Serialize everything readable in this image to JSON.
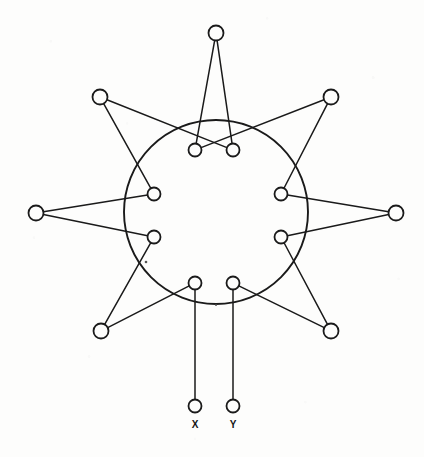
{
  "figure": {
    "kind": "node-link-diagram",
    "background_color": "#fdfdfc",
    "ink_color": "#1a1a1a"
  },
  "chart_data": {
    "type": "diagram",
    "title": "",
    "ring": {
      "cx": 216,
      "cy": 212,
      "r": 92,
      "label": "central-ring"
    },
    "labels": [
      {
        "id": "X",
        "text": "X",
        "x": 195,
        "y": 428
      },
      {
        "id": "Y",
        "text": "Y",
        "x": 233,
        "y": 428
      }
    ],
    "nodes": [
      {
        "id": "i1",
        "group": "inner",
        "x": 195,
        "y": 150,
        "r": 6.5,
        "name": "inner-node-top-left"
      },
      {
        "id": "i2",
        "group": "inner",
        "x": 233,
        "y": 150,
        "r": 6.5,
        "name": "inner-node-top-right"
      },
      {
        "id": "i3",
        "group": "inner",
        "x": 154,
        "y": 194,
        "r": 6.5,
        "name": "inner-node-upper-left"
      },
      {
        "id": "i4",
        "group": "inner",
        "x": 281,
        "y": 194,
        "r": 6.5,
        "name": "inner-node-upper-right"
      },
      {
        "id": "i5",
        "group": "inner",
        "x": 154,
        "y": 237,
        "r": 6.5,
        "name": "inner-node-lower-left"
      },
      {
        "id": "i6",
        "group": "inner",
        "x": 281,
        "y": 237,
        "r": 6.5,
        "name": "inner-node-lower-right"
      },
      {
        "id": "i7",
        "group": "inner",
        "x": 195,
        "y": 283,
        "r": 6.5,
        "name": "inner-node-bottom-left"
      },
      {
        "id": "i8",
        "group": "inner",
        "x": 233,
        "y": 283,
        "r": 6.5,
        "name": "inner-node-bottom-right"
      },
      {
        "id": "o1",
        "group": "outer",
        "x": 216,
        "y": 33,
        "r": 7.5,
        "name": "outer-node-top"
      },
      {
        "id": "o2",
        "group": "outer",
        "x": 100,
        "y": 97,
        "r": 7.5,
        "name": "outer-node-upper-left"
      },
      {
        "id": "o3",
        "group": "outer",
        "x": 331,
        "y": 97,
        "r": 7.5,
        "name": "outer-node-upper-right"
      },
      {
        "id": "o4",
        "group": "outer",
        "x": 36,
        "y": 213,
        "r": 7.5,
        "name": "outer-node-left"
      },
      {
        "id": "o5",
        "group": "outer",
        "x": 396,
        "y": 213,
        "r": 7.5,
        "name": "outer-node-right"
      },
      {
        "id": "o6",
        "group": "outer",
        "x": 101,
        "y": 331,
        "r": 7.5,
        "name": "outer-node-lower-left"
      },
      {
        "id": "o7",
        "group": "outer",
        "x": 331,
        "y": 331,
        "r": 7.5,
        "name": "outer-node-lower-right"
      },
      {
        "id": "tX",
        "group": "terminal",
        "x": 195,
        "y": 406,
        "r": 6.5,
        "name": "terminal-node-x"
      },
      {
        "id": "tY",
        "group": "terminal",
        "x": 233,
        "y": 406,
        "r": 6.5,
        "name": "terminal-node-y"
      }
    ],
    "edges": [
      {
        "from": "o1",
        "to": "i1",
        "name": "edge-top-to-inner-top-left"
      },
      {
        "from": "o1",
        "to": "i2",
        "name": "edge-top-to-inner-top-right"
      },
      {
        "from": "o2",
        "to": "i2",
        "name": "edge-upper-left-to-inner-top-right"
      },
      {
        "from": "o2",
        "to": "i3",
        "name": "edge-upper-left-to-inner-upper-left"
      },
      {
        "from": "o3",
        "to": "i1",
        "name": "edge-upper-right-to-inner-top-left"
      },
      {
        "from": "o3",
        "to": "i4",
        "name": "edge-upper-right-to-inner-upper-right"
      },
      {
        "from": "o4",
        "to": "i3",
        "name": "edge-left-to-inner-upper-left"
      },
      {
        "from": "o4",
        "to": "i5",
        "name": "edge-left-to-inner-lower-left"
      },
      {
        "from": "o5",
        "to": "i4",
        "name": "edge-right-to-inner-upper-right"
      },
      {
        "from": "o5",
        "to": "i6",
        "name": "edge-right-to-inner-lower-right"
      },
      {
        "from": "o6",
        "to": "i5",
        "name": "edge-lower-left-to-inner-lower-left"
      },
      {
        "from": "o6",
        "to": "i7",
        "name": "edge-lower-left-to-inner-bottom-left"
      },
      {
        "from": "o7",
        "to": "i6",
        "name": "edge-lower-right-to-inner-lower-right"
      },
      {
        "from": "o7",
        "to": "i8",
        "name": "edge-lower-right-to-inner-bottom-right"
      },
      {
        "from": "i7",
        "to": "tX",
        "name": "edge-inner-bottom-left-to-terminal-x"
      },
      {
        "from": "i8",
        "to": "tY",
        "name": "edge-inner-bottom-right-to-terminal-y"
      }
    ],
    "specks": [
      {
        "x": 146,
        "y": 262,
        "r": 1.3
      },
      {
        "x": 216,
        "y": 305,
        "r": 1.0
      }
    ]
  }
}
